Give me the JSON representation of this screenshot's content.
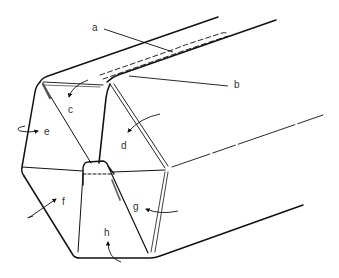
{
  "figure": {
    "colors": {
      "line": "#111111",
      "label": "#333333",
      "background": "#ffffff"
    },
    "labels": [
      {
        "id": "a",
        "text": "a",
        "x": 92,
        "y": 31
      },
      {
        "id": "b",
        "text": "b",
        "x": 234,
        "y": 88
      },
      {
        "id": "c",
        "text": "c",
        "x": 68,
        "y": 113
      },
      {
        "id": "d",
        "text": "d",
        "x": 121,
        "y": 149
      },
      {
        "id": "e",
        "text": "e",
        "x": 44,
        "y": 135
      },
      {
        "id": "f",
        "text": "f",
        "x": 62,
        "y": 205
      },
      {
        "id": "g",
        "text": "g",
        "x": 133,
        "y": 210
      },
      {
        "id": "h",
        "text": "h",
        "x": 104,
        "y": 236
      }
    ]
  }
}
